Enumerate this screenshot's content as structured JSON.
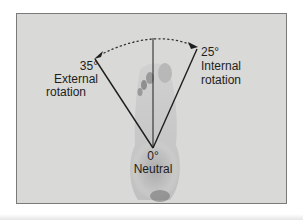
{
  "figure": {
    "background_color": "#d9d9d7",
    "line_color": "#1e1e1e",
    "vertex": {
      "angle": "0°",
      "label": "Neutral"
    },
    "left": {
      "angle": "35°",
      "label_line1": "External",
      "label_line2": "rotation"
    },
    "right": {
      "angle": "25°",
      "label_line1": "Internal",
      "label_line2": "rotation"
    },
    "arc_style": "dotted",
    "image": "foot-sole-photo"
  }
}
